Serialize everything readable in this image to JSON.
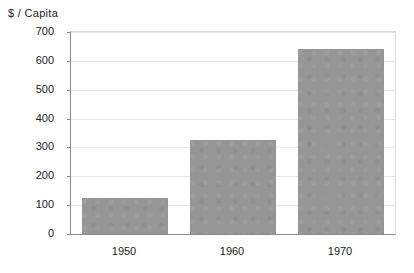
{
  "chart_data": {
    "type": "bar",
    "title": "",
    "subtitle": "",
    "xlabel": "",
    "ylabel": "$ / Capita",
    "categories": [
      "1950",
      "1960",
      "1970"
    ],
    "values": [
      125,
      325,
      640
    ],
    "series": [
      {
        "name": "$ / Capita",
        "values": [
          125,
          325,
          640
        ]
      }
    ],
    "ylim": [
      0,
      700
    ],
    "ytick_labels": [
      "0",
      "100",
      "200",
      "300",
      "400",
      "500",
      "600",
      "700"
    ],
    "ytick_values": [
      0,
      100,
      200,
      300,
      400,
      500,
      600,
      700
    ],
    "xtick_labels": [
      "1950",
      "1960",
      "1970"
    ],
    "grid": true,
    "grid_axis": "y",
    "legend": false,
    "legend_position": "none",
    "bar_color": "#969696",
    "grid_color": "#e8e8e8",
    "axis_color": "#8a8a8a",
    "background_color": "#ffffff",
    "annotations": []
  },
  "axis_title": {
    "text": "$ / Capita"
  }
}
